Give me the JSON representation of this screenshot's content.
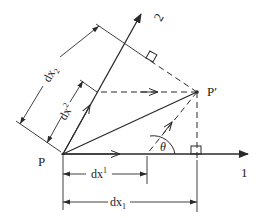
{
  "diagram": {
    "colors": {
      "ink": "#2a2a2a",
      "background": "#ffffff"
    },
    "points": {
      "origin": {
        "label": "P"
      },
      "tip": {
        "label": "P′"
      }
    },
    "axes": [
      {
        "id": "axis-1",
        "label": "1"
      },
      {
        "id": "axis-2",
        "label": "2"
      }
    ],
    "angle": {
      "label": "θ"
    },
    "dimensions": {
      "dx_upper_1": {
        "label": "dx",
        "sup": "1"
      },
      "dx_lower_1": {
        "label": "dx",
        "sub": "1"
      },
      "dx_upper_2": {
        "label": "dx",
        "sup": "2"
      },
      "dx_lower_2": {
        "label": "dx",
        "sub": "2"
      }
    }
  }
}
